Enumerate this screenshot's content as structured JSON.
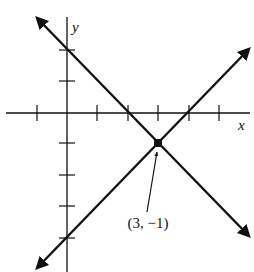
{
  "diagram": {
    "type": "coordinate-plane",
    "axes": {
      "x_label": "x",
      "y_label": "y",
      "x_ticks": [
        -1,
        1,
        2,
        3,
        4,
        5
      ],
      "y_ticks": [
        2,
        1,
        -1,
        -2,
        -3,
        -4
      ]
    },
    "lines": [
      {
        "name": "descending-line",
        "equation": "y = -x + 2",
        "x_intercept": 2,
        "y_intercept": 2
      },
      {
        "name": "ascending-line",
        "equation": "y = x - 4",
        "x_intercept": 4,
        "y_intercept": -4
      }
    ],
    "intersection": {
      "x": 3,
      "y": -1,
      "label": "(3, −1)"
    },
    "colors": {
      "ink": "#111111",
      "background": "#ffffff"
    }
  }
}
